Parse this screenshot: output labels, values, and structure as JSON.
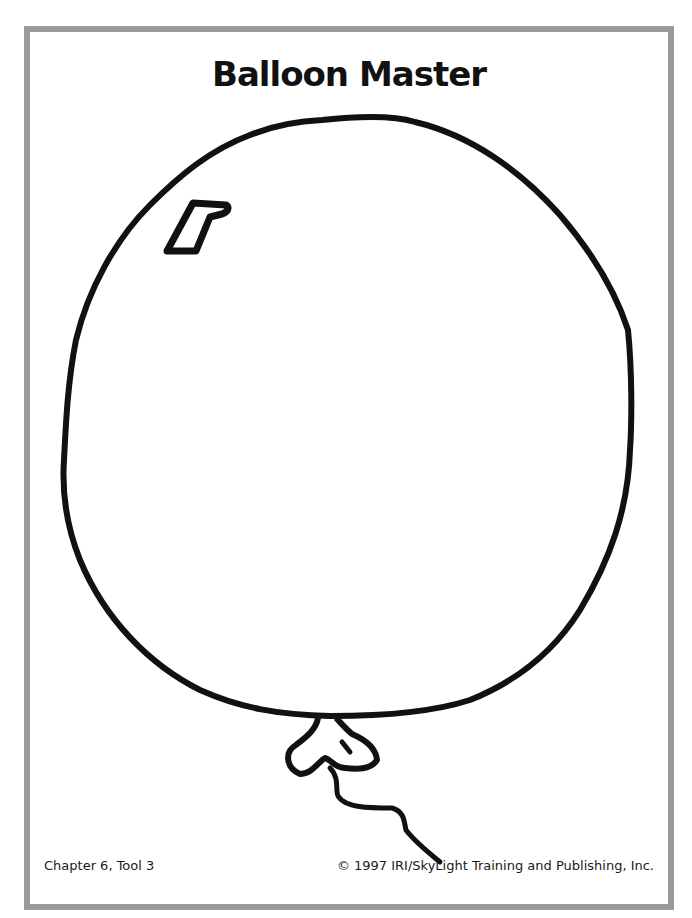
{
  "page": {
    "title": "Balloon Master",
    "footer": {
      "left": "Chapter 6, Tool 3",
      "right": "© 1997 IRI/SkyLight Training and Publishing, Inc."
    },
    "illustration": {
      "subject": "balloon-outline",
      "stroke_color": "#111111",
      "border_color": "#9a9a9a"
    }
  }
}
